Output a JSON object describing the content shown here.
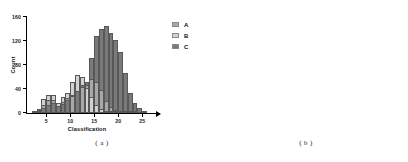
{
  "figure": {
    "panels": [
      {
        "id": "a",
        "caption": "( a )",
        "background_style": "white",
        "grid": false
      },
      {
        "id": "b",
        "caption": "( b )",
        "background_style": "gray",
        "grid": true
      }
    ]
  },
  "colors": {
    "series_a": "#a8a8a8",
    "series_b": "#d2d2d2",
    "series_c": "#7a7a7a",
    "bar_edge": "#585858",
    "axis": "#000000",
    "panel_b_background": "#dcdcdc",
    "gridline": "#ffffff"
  },
  "legend": {
    "items": [
      {
        "label": "A",
        "color": "#a8a8a8"
      },
      {
        "label": "B",
        "color": "#d2d2d2"
      },
      {
        "label": "C",
        "color": "#7a7a7a"
      }
    ]
  },
  "chart_data": {
    "type": "bar",
    "title": "",
    "xlabel": "Classification",
    "ylabel": "Count",
    "xlim": [
      1,
      26
    ],
    "ylim": [
      0,
      160
    ],
    "xticks": [
      5,
      10,
      15,
      20,
      25
    ],
    "yticks": [
      0,
      40,
      80,
      120,
      160
    ],
    "grid": "panel b only",
    "legend_position": "right",
    "bin_width": 1,
    "x": [
      2,
      3,
      4,
      5,
      6,
      7,
      8,
      9,
      10,
      11,
      12,
      13,
      14,
      15,
      16,
      17,
      18,
      19,
      20,
      21,
      22,
      23,
      24,
      25
    ],
    "series": [
      {
        "name": "A",
        "color": "#a8a8a8",
        "values": [
          3,
          7,
          13,
          22,
          21,
          12,
          18,
          25,
          29,
          37,
          44,
          46,
          56,
          52,
          38,
          20,
          10,
          5,
          3,
          2,
          1,
          1,
          0,
          0
        ]
      },
      {
        "name": "B",
        "color": "#d2d2d2",
        "values": [
          2,
          5,
          24,
          30,
          30,
          17,
          26,
          33,
          52,
          64,
          60,
          41,
          27,
          14,
          6,
          4,
          2,
          1,
          1,
          0,
          0,
          0,
          0,
          0
        ]
      },
      {
        "name": "C",
        "color": "#7a7a7a",
        "values": [
          1,
          3,
          8,
          14,
          16,
          11,
          15,
          22,
          30,
          37,
          46,
          52,
          91,
          129,
          140,
          145,
          134,
          121,
          102,
          66,
          34,
          17,
          8,
          3
        ]
      }
    ]
  }
}
